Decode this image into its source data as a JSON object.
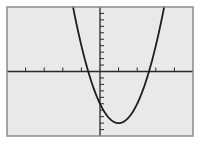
{
  "chart_data": {
    "type": "line",
    "title": "",
    "xlabel": "",
    "ylabel": "",
    "function": "y = 3x^2 - 6x - 5",
    "vertex": [
      1,
      -8
    ],
    "y_intercept": -5,
    "x_intercepts": [
      -0.633,
      2.633
    ],
    "xlim": [
      -5,
      5
    ],
    "ylim": [
      -10,
      10
    ],
    "x_tick_step": 1,
    "y_tick_step": 1,
    "grid": false,
    "legend": null,
    "series": [
      {
        "name": "parabola",
        "x": [
          -1.449,
          -1,
          -0.633,
          0,
          0.5,
          1,
          1.5,
          2,
          2.633,
          3,
          3.449
        ],
        "values": [
          10,
          4,
          0,
          -5,
          -7.25,
          -8,
          -7.25,
          -5,
          0,
          4,
          10
        ]
      }
    ]
  },
  "screen": {
    "frame": {
      "x": 7,
      "y": 7,
      "width": 186,
      "height": 129
    },
    "colors": {
      "background": "#e9e9e9",
      "border": "#8a8a8a",
      "axis": "#2a2a2a",
      "curve": "#1e1e1e",
      "page": "#ffffff"
    }
  }
}
